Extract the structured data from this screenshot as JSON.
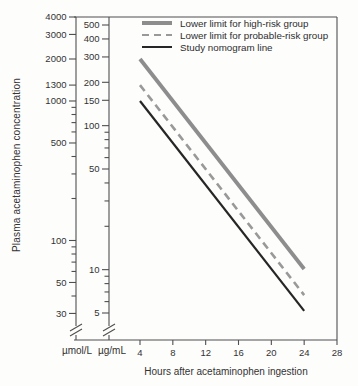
{
  "chart_data": {
    "type": "line",
    "title": "",
    "xlabel": "Hours after acetaminophen ingestion",
    "ylabel": "Plasma acetaminophen concentration",
    "x_ticks": [
      4,
      8,
      12,
      16,
      20,
      24,
      28
    ],
    "x_range": [
      4,
      28
    ],
    "y_scale": "log",
    "grid": false,
    "legend_position": "top-right-inside",
    "y_axes": [
      {
        "unit": "µmol/L",
        "labeled_ticks": [
          4000,
          3000,
          2000,
          1300,
          1000,
          500,
          100,
          50,
          30
        ],
        "minor_ticks": [
          900,
          800,
          700,
          600,
          400,
          300,
          200,
          90,
          80,
          70,
          60,
          40
        ],
        "axis_break_at_bottom": true
      },
      {
        "unit": "µg/mL",
        "labeled_ticks": [
          500,
          400,
          300,
          200,
          150,
          100,
          50,
          10,
          5
        ],
        "minor_ticks": [
          90,
          80,
          70,
          60,
          40,
          30,
          20,
          9,
          8,
          7,
          6
        ],
        "axis_break_at_bottom": true
      }
    ],
    "series": [
      {
        "name": "Lower limit for high-risk group",
        "line": "solid",
        "width": 3.8,
        "dash": null,
        "color": "#8d8d8d",
        "unit": "µmol/L",
        "points": [
          [
            4,
            2000
          ],
          [
            24,
            62.5
          ]
        ],
        "value_at_4h_ug_mL": 300
      },
      {
        "name": "Lower limit for probable-risk group",
        "line": "dashed",
        "width": 2.6,
        "dash": "7.5 5",
        "color": "#999999",
        "unit": "µmol/L",
        "points": [
          [
            4,
            1300
          ],
          [
            24,
            40.6
          ]
        ],
        "value_at_4h_ug_mL": 200
      },
      {
        "name": "Study nomogram line",
        "line": "solid",
        "width": 2.2,
        "dash": null,
        "color": "#262626",
        "unit": "µmol/L",
        "points": [
          [
            4,
            1000
          ],
          [
            24,
            31.3
          ]
        ],
        "value_at_4h_ug_mL": 150
      }
    ]
  }
}
